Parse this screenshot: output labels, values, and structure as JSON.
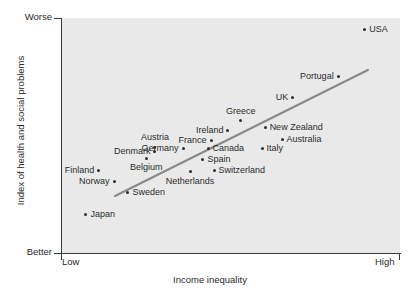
{
  "chart_data": {
    "type": "scatter",
    "title": "",
    "xlabel": "Income inequality",
    "ylabel": "Index of health and social problems",
    "x_ticks": [
      "Low",
      "High"
    ],
    "y_ticks": [
      "Worse",
      "Better"
    ],
    "y_tick_top": "Worse",
    "y_tick_bottom": "Better",
    "x_tick_left": "Low",
    "x_tick_right": "High",
    "grid": false,
    "legend": "none",
    "xlim": [
      0,
      100
    ],
    "ylim": [
      0,
      100
    ],
    "trendline": {
      "x0": 15.7,
      "y0": 24.3,
      "x1": 90.5,
      "y1": 77.9
    },
    "points": [
      {
        "label": "Japan",
        "x": 7.1,
        "y": 16.2,
        "label_pos": "right"
      },
      {
        "label": "Finland",
        "x": 10.9,
        "y": 35.3,
        "label_pos": "left"
      },
      {
        "label": "Norway",
        "x": 15.4,
        "y": 30.6,
        "label_pos": "left"
      },
      {
        "label": "Sweden",
        "x": 19.5,
        "y": 25.9,
        "label_pos": "right"
      },
      {
        "label": "Denmark",
        "x": 27.5,
        "y": 43.0,
        "label_pos": "left"
      },
      {
        "label": "Belgium",
        "x": 24.9,
        "y": 40.4,
        "label_pos": "below"
      },
      {
        "label": "Austria",
        "x": 27.5,
        "y": 45.1,
        "label_pos": "above"
      },
      {
        "label": "Germany",
        "x": 35.8,
        "y": 44.3,
        "label_pos": "left"
      },
      {
        "label": "Netherlands",
        "x": 37.9,
        "y": 34.5,
        "label_pos": "below"
      },
      {
        "label": "France",
        "x": 44.1,
        "y": 47.7,
        "label_pos": "left"
      },
      {
        "label": "Canada",
        "x": 43.2,
        "y": 44.3,
        "label_pos": "right"
      },
      {
        "label": "Spain",
        "x": 41.7,
        "y": 39.6,
        "label_pos": "right"
      },
      {
        "label": "Switzerland",
        "x": 45.0,
        "y": 34.9,
        "label_pos": "right"
      },
      {
        "label": "Ireland",
        "x": 49.1,
        "y": 52.3,
        "label_pos": "left"
      },
      {
        "label": "Greece",
        "x": 52.9,
        "y": 56.2,
        "label_pos": "above"
      },
      {
        "label": "Italy",
        "x": 59.2,
        "y": 44.3,
        "label_pos": "right"
      },
      {
        "label": "New Zealand",
        "x": 60.1,
        "y": 53.2,
        "label_pos": "right"
      },
      {
        "label": "Australia",
        "x": 65.1,
        "y": 48.5,
        "label_pos": "right"
      },
      {
        "label": "UK",
        "x": 68.3,
        "y": 66.0,
        "label_pos": "left"
      },
      {
        "label": "Portugal",
        "x": 81.7,
        "y": 75.3,
        "label_pos": "left"
      },
      {
        "label": "USA",
        "x": 89.6,
        "y": 95.3,
        "label_pos": "right"
      }
    ]
  },
  "colors": {
    "plot_background": "#e9e9e9",
    "axis": "#3a3a3a",
    "dot": "#2e2e2e",
    "trendline": "#8a8a8a",
    "text": "#2b2b2b"
  }
}
